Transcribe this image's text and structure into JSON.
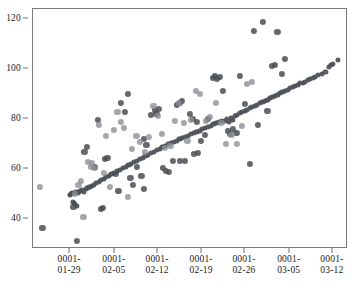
{
  "figure": {
    "background_color": "#ffffff",
    "frame_color": "#7a7a7a",
    "caption": ""
  },
  "chart_data": {
    "type": "scatter",
    "title": "",
    "xlabel": "",
    "ylabel": "",
    "grid": false,
    "legend": null,
    "xlim": [
      "0001-01-25",
      "0001-03-15"
    ],
    "ylim": [
      28,
      124
    ],
    "yticks": [
      40,
      60,
      80,
      100,
      120
    ],
    "ytick_labels": [
      "40",
      "60",
      "80",
      "100",
      "120"
    ],
    "xticks": [
      "0001-01-29",
      "0001-02-05",
      "0001-02-12",
      "0001-02-19",
      "0001-02-26",
      "0001-03-05",
      "0001-03-12"
    ],
    "xtick_labels": [
      {
        "line1": "0001-",
        "line2": "01-29"
      },
      {
        "line1": "0001-",
        "line2": "02-05"
      },
      {
        "line1": "0001-",
        "line2": "02-12"
      },
      {
        "line1": "0001-",
        "line2": "02-19"
      },
      {
        "line1": "0001-",
        "line2": "02-26"
      },
      {
        "line1": "0001-",
        "line2": "03-05"
      },
      {
        "line1": "0001-",
        "line2": "03-12"
      }
    ],
    "series": [
      {
        "name": "fitted-band",
        "color": "#4d5057",
        "marker": "circle",
        "marker_size": 5.2,
        "opacity": 0.92,
        "points": [
          [
            0.118,
            49.8
          ],
          [
            0.121,
            50.1
          ],
          [
            0.124,
            50.3
          ],
          [
            0.127,
            47.0
          ],
          [
            0.129,
            46.3
          ],
          [
            0.131,
            50.6
          ],
          [
            0.134,
            45.9
          ],
          [
            0.136,
            51.0
          ],
          [
            0.139,
            45.4
          ],
          [
            0.142,
            50.4
          ],
          [
            0.145,
            50.9
          ],
          [
            0.15,
            51.2
          ],
          [
            0.156,
            51.6
          ],
          [
            0.161,
            51.0
          ],
          [
            0.167,
            52.0
          ],
          [
            0.173,
            52.4
          ],
          [
            0.179,
            52.8
          ],
          [
            0.186,
            53.3
          ],
          [
            0.193,
            53.8
          ],
          [
            0.2,
            54.3
          ],
          [
            0.208,
            54.9
          ],
          [
            0.216,
            55.5
          ],
          [
            0.224,
            56.1
          ],
          [
            0.232,
            56.7
          ],
          [
            0.24,
            57.3
          ],
          [
            0.249,
            57.9
          ],
          [
            0.258,
            58.5
          ],
          [
            0.267,
            59.1
          ],
          [
            0.276,
            59.7
          ],
          [
            0.285,
            60.3
          ],
          [
            0.294,
            60.9
          ],
          [
            0.303,
            61.5
          ],
          [
            0.312,
            62.1
          ],
          [
            0.321,
            62.7
          ],
          [
            0.33,
            63.3
          ],
          [
            0.339,
            63.9
          ],
          [
            0.348,
            64.5
          ],
          [
            0.357,
            65.1
          ],
          [
            0.366,
            65.7
          ],
          [
            0.375,
            66.3
          ],
          [
            0.384,
            66.9
          ],
          [
            0.393,
            67.5
          ],
          [
            0.402,
            68.1
          ],
          [
            0.411,
            68.7
          ],
          [
            0.42,
            69.3
          ],
          [
            0.429,
            69.9
          ],
          [
            0.438,
            70.4
          ],
          [
            0.447,
            70.9
          ],
          [
            0.456,
            71.4
          ],
          [
            0.465,
            71.9
          ],
          [
            0.474,
            72.4
          ],
          [
            0.483,
            72.9
          ],
          [
            0.492,
            73.4
          ],
          [
            0.501,
            73.9
          ],
          [
            0.51,
            74.4
          ],
          [
            0.519,
            74.9
          ],
          [
            0.528,
            75.4
          ],
          [
            0.537,
            75.9
          ],
          [
            0.546,
            76.4
          ],
          [
            0.555,
            76.9
          ],
          [
            0.564,
            77.4
          ],
          [
            0.573,
            77.9
          ],
          [
            0.582,
            78.4
          ],
          [
            0.591,
            78.9
          ],
          [
            0.6,
            79.4
          ],
          [
            0.609,
            79.3
          ],
          [
            0.615,
            80.0
          ],
          [
            0.621,
            79.0
          ],
          [
            0.627,
            80.6
          ],
          [
            0.633,
            79.6
          ],
          [
            0.64,
            81.2
          ],
          [
            0.648,
            81.8
          ],
          [
            0.656,
            82.3
          ],
          [
            0.664,
            82.8
          ],
          [
            0.672,
            83.3
          ],
          [
            0.68,
            83.8
          ],
          [
            0.688,
            84.3
          ],
          [
            0.696,
            84.8
          ],
          [
            0.704,
            85.3
          ],
          [
            0.712,
            85.8
          ],
          [
            0.72,
            86.3
          ],
          [
            0.728,
            86.8
          ],
          [
            0.736,
            87.3
          ],
          [
            0.744,
            87.8
          ],
          [
            0.752,
            88.3
          ],
          [
            0.76,
            88.8
          ],
          [
            0.768,
            89.3
          ],
          [
            0.776,
            89.8
          ],
          [
            0.784,
            90.3
          ],
          [
            0.792,
            90.8
          ],
          [
            0.8,
            91.3
          ],
          [
            0.808,
            91.8
          ],
          [
            0.816,
            92.3
          ],
          [
            0.824,
            92.8
          ],
          [
            0.832,
            93.3
          ],
          [
            0.84,
            93.8
          ],
          [
            0.848,
            94.3
          ],
          [
            0.856,
            94.4
          ],
          [
            0.864,
            95.0
          ],
          [
            0.872,
            95.5
          ],
          [
            0.88,
            96.0
          ],
          [
            0.888,
            96.5
          ],
          [
            0.896,
            97.0
          ],
          [
            0.904,
            97.5
          ],
          [
            0.916,
            98.0
          ],
          [
            0.928,
            98.8
          ],
          [
            0.94,
            100.8
          ],
          [
            0.945,
            101.6
          ],
          [
            0.952,
            102.0
          ],
          [
            0.968,
            103.8
          ]
        ]
      },
      {
        "name": "observed-dark",
        "color": "#4a4d54",
        "marker": "circle",
        "marker_size": 6.2,
        "opacity": 0.85,
        "points": [
          [
            0.03,
            36.4
          ],
          [
            0.14,
            31.2
          ],
          [
            0.128,
            44.9
          ],
          [
            0.171,
            68.8
          ],
          [
            0.163,
            66.9
          ],
          [
            0.205,
            79.8
          ],
          [
            0.196,
            61.0
          ],
          [
            0.236,
            64.6
          ],
          [
            0.229,
            64.2
          ],
          [
            0.216,
            44.2
          ],
          [
            0.222,
            44.4
          ],
          [
            0.262,
            58.0
          ],
          [
            0.271,
            51.2
          ],
          [
            0.28,
            86.3
          ],
          [
            0.292,
            83.0
          ],
          [
            0.3,
            89.9
          ],
          [
            0.309,
            56.4
          ],
          [
            0.318,
            53.7
          ],
          [
            0.33,
            60.8
          ],
          [
            0.344,
            57.1
          ],
          [
            0.352,
            71.9
          ],
          [
            0.36,
            69.6
          ],
          [
            0.375,
            81.6
          ],
          [
            0.386,
            83.5
          ],
          [
            0.392,
            82.2
          ],
          [
            0.4,
            84.0
          ],
          [
            0.412,
            60.6
          ],
          [
            0.423,
            59.3
          ],
          [
            0.432,
            59.0
          ],
          [
            0.445,
            63.1
          ],
          [
            0.458,
            85.6
          ],
          [
            0.466,
            86.3
          ],
          [
            0.474,
            87.2
          ],
          [
            0.482,
            63.4
          ],
          [
            0.497,
            82.0
          ],
          [
            0.508,
            80.1
          ],
          [
            0.52,
            79.0
          ],
          [
            0.534,
            71.1
          ],
          [
            0.545,
            73.6
          ],
          [
            0.556,
            80.2
          ],
          [
            0.57,
            96.6
          ],
          [
            0.578,
            97.3
          ],
          [
            0.585,
            95.9
          ],
          [
            0.594,
            97.0
          ],
          [
            0.604,
            91.3
          ],
          [
            0.618,
            75.3
          ],
          [
            0.626,
            74.1
          ],
          [
            0.634,
            76.0
          ],
          [
            0.646,
            74.5
          ],
          [
            0.658,
            97.3
          ],
          [
            0.672,
            86.2
          ],
          [
            0.688,
            62.2
          ],
          [
            0.7,
            115.3
          ],
          [
            0.714,
            77.5
          ],
          [
            0.73,
            118.7
          ],
          [
            0.744,
            83.4
          ],
          [
            0.758,
            101.2
          ],
          [
            0.768,
            101.8
          ],
          [
            0.776,
            115.0
          ],
          [
            0.79,
            98.0
          ],
          [
            0.8,
            103.9
          ],
          [
            0.512,
            65.9
          ],
          [
            0.524,
            66.4
          ],
          [
            0.466,
            63.3
          ],
          [
            0.352,
            52.2
          ]
        ]
      },
      {
        "name": "observed-light",
        "color": "#8e9096",
        "marker": "circle",
        "marker_size": 6.2,
        "opacity": 0.8,
        "points": [
          [
            0.022,
            53.0
          ],
          [
            0.151,
            55.2
          ],
          [
            0.16,
            41.0
          ],
          [
            0.185,
            60.8
          ],
          [
            0.195,
            60.6
          ],
          [
            0.21,
            77.6
          ],
          [
            0.232,
            73.3
          ],
          [
            0.245,
            52.9
          ],
          [
            0.256,
            75.6
          ],
          [
            0.268,
            82.8
          ],
          [
            0.278,
            78.8
          ],
          [
            0.288,
            76.3
          ],
          [
            0.302,
            48.8
          ],
          [
            0.315,
            68.2
          ],
          [
            0.328,
            73.4
          ],
          [
            0.34,
            70.8
          ],
          [
            0.355,
            66.9
          ],
          [
            0.368,
            72.9
          ],
          [
            0.382,
            85.4
          ],
          [
            0.396,
            81.4
          ],
          [
            0.408,
            74.1
          ],
          [
            0.42,
            68.5
          ],
          [
            0.436,
            69.3
          ],
          [
            0.45,
            79.1
          ],
          [
            0.462,
            86.5
          ],
          [
            0.478,
            78.3
          ],
          [
            0.49,
            71.3
          ],
          [
            0.502,
            79.6
          ],
          [
            0.516,
            91.1
          ],
          [
            0.53,
            90.2
          ],
          [
            0.548,
            79.2
          ],
          [
            0.562,
            80.8
          ],
          [
            0.58,
            86.5
          ],
          [
            0.598,
            78.3
          ],
          [
            0.612,
            69.9
          ],
          [
            0.63,
            73.6
          ],
          [
            0.648,
            70.1
          ],
          [
            0.664,
            77.4
          ],
          [
            0.68,
            94.2
          ],
          [
            0.694,
            94.8
          ],
          [
            0.132,
            50.2
          ],
          [
            0.144,
            53.6
          ],
          [
            0.175,
            63.0
          ],
          [
            0.188,
            62.4
          ],
          [
            0.226,
            58.6
          ]
        ]
      }
    ]
  }
}
